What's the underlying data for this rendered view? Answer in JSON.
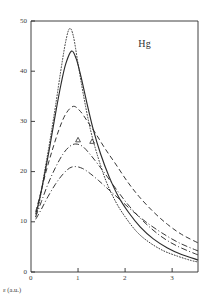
{
  "figure": {
    "species_label": "Hg",
    "axis_caption": "ε (a.u.)",
    "ink_color": "#2b2b2b",
    "background_color": "#ffffff"
  },
  "chart_data": {
    "type": "line",
    "title": "",
    "subtitle": "",
    "annotations": [
      {
        "text": "Hg",
        "x": 2.45,
        "y": 45.5
      }
    ],
    "xlabel": "ε (a.u.)",
    "ylabel": "",
    "xlim": [
      0,
      3.55
    ],
    "ylim": [
      0,
      50
    ],
    "xticks": [
      0,
      1,
      2,
      3
    ],
    "xticklabels": [
      "0",
      "1",
      "2",
      "3"
    ],
    "yticks": [
      0,
      10,
      20,
      30,
      40,
      50
    ],
    "yticklabels": [
      "0",
      "10",
      "20",
      "30",
      "40",
      "50"
    ],
    "grid": false,
    "legend": "none",
    "legend_entries": [],
    "series": [
      {
        "name": "curve-dotted",
        "style": "dotted",
        "peak_x": 0.82,
        "peak_y": 48.5,
        "x": [
          0.1,
          0.18,
          0.28,
          0.4,
          0.52,
          0.64,
          0.74,
          0.82,
          0.9,
          1.0,
          1.12,
          1.26,
          1.42,
          1.6,
          1.8,
          2.0,
          2.25,
          2.5,
          2.8,
          3.1,
          3.4,
          3.55
        ],
        "values": [
          11.0,
          14.0,
          19.5,
          26.0,
          33.0,
          40.5,
          46.0,
          48.5,
          47.0,
          41.5,
          35.0,
          28.5,
          23.0,
          18.0,
          14.0,
          11.0,
          8.0,
          6.0,
          4.3,
          3.2,
          2.3,
          2.0
        ]
      },
      {
        "name": "curve-solid",
        "style": "solid",
        "peak_x": 0.86,
        "peak_y": 44.0,
        "x": [
          0.1,
          0.18,
          0.28,
          0.4,
          0.52,
          0.64,
          0.74,
          0.86,
          0.96,
          1.06,
          1.18,
          1.32,
          1.48,
          1.66,
          1.86,
          2.08,
          2.32,
          2.6,
          2.9,
          3.2,
          3.55
        ],
        "values": [
          11.5,
          14.5,
          19.0,
          25.0,
          31.5,
          37.5,
          41.5,
          44.0,
          42.5,
          39.0,
          34.0,
          28.5,
          23.5,
          19.0,
          15.0,
          11.8,
          9.0,
          6.6,
          4.8,
          3.5,
          2.4
        ]
      },
      {
        "name": "curve-dashed",
        "style": "dashed",
        "peak_x": 0.9,
        "peak_y": 33.0,
        "x": [
          0.1,
          0.2,
          0.32,
          0.46,
          0.6,
          0.74,
          0.9,
          1.05,
          1.2,
          1.38,
          1.58,
          1.8,
          2.05,
          2.3,
          2.6,
          2.9,
          3.2,
          3.55
        ],
        "values": [
          12.0,
          15.5,
          20.0,
          24.5,
          28.5,
          31.5,
          33.0,
          32.0,
          30.0,
          27.5,
          24.5,
          21.5,
          18.0,
          15.0,
          12.0,
          9.5,
          7.5,
          5.8
        ]
      },
      {
        "name": "curve-dash-dot-upper",
        "style": "dash-dot",
        "peak_x": 0.95,
        "peak_y": 25.5,
        "x": [
          0.1,
          0.22,
          0.36,
          0.52,
          0.68,
          0.82,
          0.95,
          1.1,
          1.25,
          1.42,
          1.62,
          1.85,
          2.1,
          2.4,
          2.75,
          3.1,
          3.55
        ],
        "values": [
          11.0,
          14.0,
          17.5,
          20.8,
          23.5,
          25.0,
          25.5,
          25.0,
          23.5,
          21.5,
          19.0,
          16.0,
          13.0,
          10.0,
          7.2,
          5.2,
          3.4
        ]
      },
      {
        "name": "curve-dash-dot-lower",
        "style": "dash-dot",
        "peak_x": 0.95,
        "peak_y": 21.0,
        "x": [
          0.1,
          0.22,
          0.36,
          0.52,
          0.68,
          0.82,
          0.95,
          1.1,
          1.26,
          1.44,
          1.64,
          1.88,
          2.14,
          2.44,
          2.78,
          3.15,
          3.55
        ],
        "values": [
          10.5,
          12.5,
          15.0,
          17.5,
          19.5,
          20.7,
          21.0,
          20.6,
          19.6,
          18.2,
          16.5,
          14.5,
          12.3,
          10.0,
          7.8,
          5.8,
          4.2
        ]
      }
    ],
    "markers": [
      {
        "name": "triangle-marker-1",
        "shape": "triangle",
        "x": 1.0,
        "y": 26.3
      },
      {
        "name": "triangle-marker-2",
        "shape": "triangle",
        "x": 1.3,
        "y": 26.0
      }
    ]
  }
}
